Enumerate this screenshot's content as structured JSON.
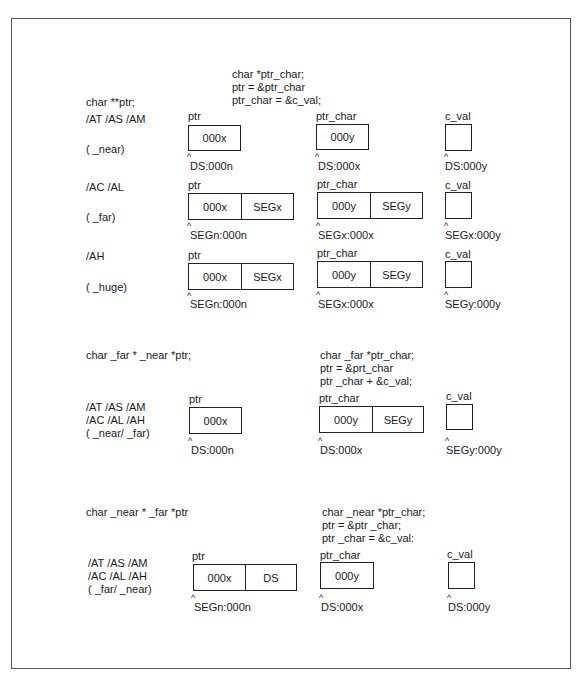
{
  "sections": [
    {
      "declaration": "char **ptr;",
      "code": [
        "char *ptr_char;",
        "ptr = &ptr_char",
        "ptr_char = &c_val;"
      ],
      "rows": [
        {
          "options": "/AT /AS /AM",
          "model": "( _near)",
          "ptr": {
            "label": "ptr",
            "cells": [
              "000x"
            ],
            "address": "DS:000n"
          },
          "ptr_char": {
            "label": "ptr_char",
            "cells": [
              "000y"
            ],
            "address": "DS:000x"
          },
          "c_val": {
            "label": "c_val",
            "address": "DS:000y"
          }
        },
        {
          "options": "/AC /AL",
          "model": "( _far)",
          "ptr": {
            "label": "ptr",
            "cells": [
              "000x",
              "SEGx"
            ],
            "address": "SEGn:000n"
          },
          "ptr_char": {
            "label": "ptr_char",
            "cells": [
              "000y",
              "SEGy"
            ],
            "address": "SEGx:000x"
          },
          "c_val": {
            "label": "c_val",
            "address": "SEGx:000y"
          }
        },
        {
          "options": "/AH",
          "model": "( _huge)",
          "ptr": {
            "label": "ptr",
            "cells": [
              "000x",
              "SEGx"
            ],
            "address": "SEGn:000n"
          },
          "ptr_char": {
            "label": "ptr_char",
            "cells": [
              "000y",
              "SEGy"
            ],
            "address": "SEGx:000x"
          },
          "c_val": {
            "label": "c_val",
            "address": "SEGy:000y"
          }
        }
      ]
    },
    {
      "declaration": "char _far * _near *ptr;",
      "code": [
        "char _far *ptr_char;",
        "ptr = &prt_char",
        "ptr _char + &c_val;"
      ],
      "options_lines": [
        "/AT /AS /AM",
        "/AC /AL /AH",
        "( _near/ _far)"
      ],
      "ptr": {
        "label": "ptr",
        "cells": [
          "000x"
        ],
        "address": "DS:000n"
      },
      "ptr_char": {
        "label": "ptr_char",
        "cells": [
          "000y",
          "SEGy"
        ],
        "address": "DS:000x"
      },
      "c_val": {
        "label": "c_val",
        "address": "SEGy:000y"
      }
    },
    {
      "declaration": "char _near * _far *ptr",
      "code": [
        "char _near *ptr_char;",
        "ptr = &ptr _char;",
        "ptr _char = &c_val:"
      ],
      "options_lines": [
        "/AT /AS /AM",
        "/AC /AL /AH",
        "( _far/ _near)"
      ],
      "ptr": {
        "label": "ptr",
        "cells": [
          "000x",
          "DS"
        ],
        "address": "SEGn:000n"
      },
      "ptr_char": {
        "label": "ptr_char",
        "cells": [
          "000y"
        ],
        "address": "DS:000x"
      },
      "c_val": {
        "label": "c_val",
        "address": "DS:000y"
      }
    }
  ],
  "caret_glyph": "^"
}
